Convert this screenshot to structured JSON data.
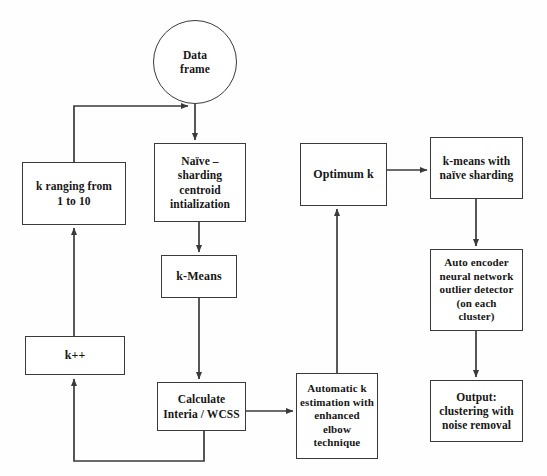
{
  "diagram": {
    "type": "flowchart",
    "canvas": {
      "width": 547,
      "height": 476
    },
    "stroke_color": "#3a3a3a",
    "text_color": "#161616",
    "background_color": "#fefefe"
  },
  "nodes": {
    "data_frame": {
      "label": "Data\nframe",
      "shape": "circle"
    },
    "k_range": {
      "label": "k ranging from\n1 to 10",
      "shape": "rect"
    },
    "k_increment": {
      "label": "k++",
      "shape": "rect"
    },
    "naive_sharding": {
      "label": "Naïve –\nsharding\ncentroid\nintialization",
      "shape": "rect"
    },
    "k_means": {
      "label": "k-Means",
      "shape": "rect"
    },
    "calculate_wcss": {
      "label": "Calculate\nInteria / WCSS",
      "shape": "rect"
    },
    "automatic_k": {
      "label": "Automatic k\nestimation with\nenhanced\nelbow\ntechnique",
      "shape": "rect"
    },
    "optimum_k": {
      "label": "Optimum k",
      "shape": "rect"
    },
    "kmeans_sharding": {
      "label": "k-means with\nnaïve sharding",
      "shape": "rect"
    },
    "auto_encoder": {
      "label": "Auto encoder\nneural network\noutlier detector\n(on each\ncluster)",
      "shape": "rect"
    },
    "output": {
      "label": "Output:\nclustering with\nnoise removal",
      "shape": "rect"
    }
  },
  "edges": [
    {
      "name": "data-frame-to-naive-sharding",
      "from": "data_frame",
      "to": "naive_sharding",
      "arrow": "down"
    },
    {
      "name": "k-range-to-data-frame-path",
      "from": "k_range",
      "to": "data_frame",
      "arrow": "right"
    },
    {
      "name": "naive-sharding-to-k-means",
      "from": "naive_sharding",
      "to": "k_means",
      "arrow": "down"
    },
    {
      "name": "k-means-to-calculate-wcss",
      "from": "k_means",
      "to": "calculate_wcss",
      "arrow": "down"
    },
    {
      "name": "calculate-wcss-to-k-increment",
      "from": "calculate_wcss",
      "to": "k_increment",
      "arrow": "up"
    },
    {
      "name": "k-increment-to-k-range",
      "from": "k_increment",
      "to": "k_range",
      "arrow": "up"
    },
    {
      "name": "calculate-wcss-to-automatic-k",
      "from": "calculate_wcss",
      "to": "automatic_k",
      "arrow": "right"
    },
    {
      "name": "automatic-k-to-optimum-k",
      "from": "automatic_k",
      "to": "optimum_k",
      "arrow": "up"
    },
    {
      "name": "optimum-k-to-kmeans-sharding",
      "from": "optimum_k",
      "to": "kmeans_sharding",
      "arrow": "right"
    },
    {
      "name": "kmeans-sharding-to-auto-encoder",
      "from": "kmeans_sharding",
      "to": "auto_encoder",
      "arrow": "down"
    },
    {
      "name": "auto-encoder-to-output",
      "from": "auto_encoder",
      "to": "output",
      "arrow": "down"
    }
  ]
}
